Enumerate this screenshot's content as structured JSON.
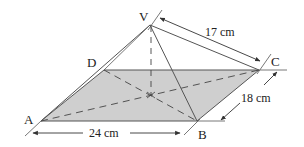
{
  "figure": {
    "type": "square-based pyramid diagram",
    "base_fill": "#cfcfcf",
    "line_color": "#444444",
    "vertices": {
      "V": {
        "label": "V"
      },
      "A": {
        "label": "A"
      },
      "B": {
        "label": "B"
      },
      "C": {
        "label": "C"
      },
      "D": {
        "label": "D"
      }
    },
    "dimensions": {
      "VC": "17 cm",
      "BC": "18 cm",
      "AB": "24 cm"
    }
  }
}
